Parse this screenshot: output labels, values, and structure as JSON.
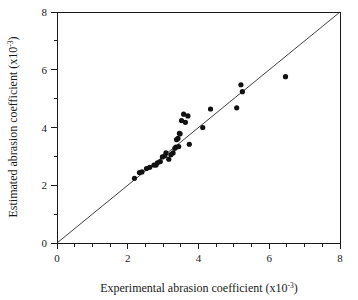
{
  "chart_data": {
    "type": "scatter",
    "title": "",
    "xlabel": "Experimental abrasion coefficient (x10",
    "xlabel_sup": "-3",
    "xlabel_tail": ")",
    "ylabel": "Estimated abrasion coefficient (x10",
    "ylabel_sup": "-3",
    "ylabel_tail": ")",
    "xlim": [
      0,
      8
    ],
    "ylim": [
      0,
      8
    ],
    "xticks": [
      0,
      2,
      4,
      6,
      8
    ],
    "yticks": [
      0,
      2,
      4,
      6,
      8
    ],
    "xtick_labels": [
      "0",
      "2",
      "4",
      "6",
      "8"
    ],
    "ytick_labels": [
      "0",
      "2",
      "4",
      "6",
      "8"
    ],
    "minor_xticks": [
      0.5,
      1,
      1.5,
      2.5,
      3,
      3.5,
      4.5,
      5,
      5.5,
      6.5,
      7,
      7.5
    ],
    "minor_yticks": [
      1,
      3,
      5,
      7
    ],
    "grid": false,
    "legend": false,
    "marker": "filled-circle",
    "marker_color": "#111111",
    "reference_line": {
      "name": "identity-line",
      "from": [
        0,
        0
      ],
      "to": [
        8,
        8
      ],
      "color": "#2a2a2a"
    },
    "x": [
      2.19,
      2.33,
      2.4,
      2.53,
      2.62,
      2.74,
      2.8,
      2.84,
      2.92,
      2.98,
      3.05,
      3.08,
      3.16,
      3.22,
      3.28,
      3.33,
      3.36,
      3.38,
      3.42,
      3.44,
      3.46,
      3.48,
      3.52,
      3.58,
      3.63,
      3.7,
      3.74,
      4.12,
      4.34,
      5.08,
      5.2,
      5.24,
      6.46
    ],
    "y": [
      2.24,
      2.44,
      2.46,
      2.58,
      2.62,
      2.7,
      2.7,
      2.78,
      2.82,
      2.98,
      3.02,
      3.12,
      2.9,
      3.06,
      3.12,
      3.28,
      3.32,
      3.58,
      3.62,
      3.34,
      3.8,
      3.78,
      4.24,
      4.46,
      4.18,
      4.4,
      3.42,
      4.0,
      4.64,
      4.68,
      5.48,
      5.24,
      5.76
    ],
    "n_points": 33
  }
}
